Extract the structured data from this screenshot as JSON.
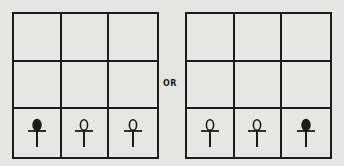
{
  "separator": {
    "label": "OR"
  },
  "colors": {
    "line": "#1c1c1c",
    "background": "#e4e4e2"
  },
  "boards": [
    {
      "id": "left",
      "rows": [
        [
          "",
          "",
          ""
        ],
        [
          "",
          "",
          ""
        ],
        [
          "ankh-filled",
          "ankh-hollow",
          "ankh-hollow"
        ]
      ]
    },
    {
      "id": "right",
      "rows": [
        [
          "",
          "",
          ""
        ],
        [
          "",
          "",
          ""
        ],
        [
          "ankh-hollow",
          "ankh-hollow",
          "ankh-filled"
        ]
      ]
    }
  ]
}
